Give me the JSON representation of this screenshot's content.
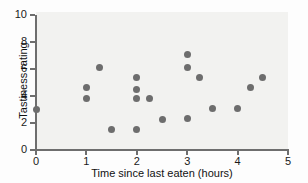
{
  "chart_data": {
    "type": "scatter",
    "title": "",
    "xlabel": "Time since last eaten (hours)",
    "ylabel": "Tastiness rating",
    "xlim": [
      0,
      5
    ],
    "ylim": [
      0,
      10
    ],
    "xticks": [
      0,
      1,
      2,
      3,
      4,
      5
    ],
    "yticks": [
      0,
      2,
      4,
      6,
      8,
      10
    ],
    "xtick_labels": [
      "0",
      "1",
      "2",
      "3",
      "4",
      "5"
    ],
    "ytick_labels": [
      "0",
      "2",
      "4",
      "6",
      "8",
      "10"
    ],
    "grid": false,
    "legend": "none",
    "marker_color": "#6d6d6d",
    "panel_color": "#f2f2f0",
    "axis_color": "#6e6e6e",
    "points": [
      {
        "x": 0,
        "y": 3.0
      },
      {
        "x": 1.0,
        "y": 4.6
      },
      {
        "x": 1.0,
        "y": 3.8
      },
      {
        "x": 1.25,
        "y": 6.1
      },
      {
        "x": 1.5,
        "y": 1.5
      },
      {
        "x": 2.0,
        "y": 5.4
      },
      {
        "x": 2.0,
        "y": 4.5
      },
      {
        "x": 2.0,
        "y": 3.8
      },
      {
        "x": 2.0,
        "y": 1.55
      },
      {
        "x": 2.25,
        "y": 3.8
      },
      {
        "x": 2.5,
        "y": 2.25
      },
      {
        "x": 3.0,
        "y": 7.05
      },
      {
        "x": 3.0,
        "y": 6.1
      },
      {
        "x": 3.0,
        "y": 2.3
      },
      {
        "x": 3.25,
        "y": 5.4
      },
      {
        "x": 3.5,
        "y": 3.05
      },
      {
        "x": 4.0,
        "y": 3.1
      },
      {
        "x": 4.25,
        "y": 4.65
      },
      {
        "x": 4.5,
        "y": 5.4
      }
    ]
  }
}
